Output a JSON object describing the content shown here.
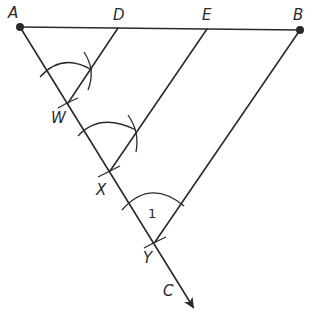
{
  "figure": {
    "type": "geometric-construction",
    "colors": {
      "stroke": "#2a2a2a",
      "background": "#ffffff"
    }
  },
  "points": {
    "A": {
      "label": "A",
      "x": 20,
      "y": 27
    },
    "D": {
      "label": "D",
      "x": 118,
      "y": 28
    },
    "E": {
      "label": "E",
      "x": 207,
      "y": 29
    },
    "B": {
      "label": "B",
      "x": 300,
      "y": 30
    },
    "W": {
      "label": "W",
      "x": 68,
      "y": 103
    },
    "X": {
      "label": "X",
      "x": 110,
      "y": 171
    },
    "Y": {
      "label": "Y",
      "x": 155,
      "y": 242
    },
    "C": {
      "label": "C"
    }
  },
  "angle_label": "1",
  "segments": [
    "AB",
    "ray AC",
    "DW",
    "EX",
    "BY"
  ]
}
